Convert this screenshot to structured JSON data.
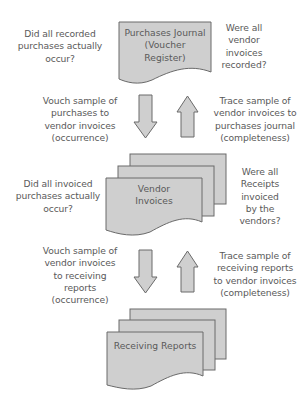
{
  "colors": {
    "shape_fill": "#cfcfcf",
    "shape_stroke": "#6a6a6a",
    "text": "#5a5a5a"
  },
  "documents": [
    {
      "id": "purchases-journal",
      "lines": [
        "Purchases Journal",
        "(Voucher",
        "Register)"
      ]
    },
    {
      "id": "vendor-invoices",
      "lines": [
        "Vendor",
        "Invoices"
      ]
    },
    {
      "id": "receiving-reports",
      "lines": [
        "Receiving Reports"
      ]
    }
  ],
  "questions": {
    "top_left": [
      "Did all recorded",
      "purchases actually",
      "occur?"
    ],
    "top_right": [
      "Were all",
      "vendor",
      "invoices",
      "recorded?"
    ],
    "middle_left": [
      "Did all invoiced",
      "purchases actually",
      "occur?"
    ],
    "middle_right": [
      "Were all",
      "Receipts",
      "invoiced",
      "by the",
      "vendors?"
    ]
  },
  "procedures": {
    "vouch_1": [
      "Vouch sample of",
      "purchases to",
      "vendor invoices",
      "(occurrence)"
    ],
    "trace_1": [
      "Trace sample of",
      "vendor invoices to",
      "purchases journal",
      "(completeness)"
    ],
    "vouch_2": [
      "Vouch sample of",
      "vendor invoices",
      "to receiving",
      "reports",
      "(occurrence)"
    ],
    "trace_2": [
      "Trace sample of",
      "receiving reports",
      "to vendor invoices",
      "(completeness)"
    ]
  },
  "arrows": [
    {
      "id": "vouch-arrow-1",
      "direction": "down"
    },
    {
      "id": "trace-arrow-1",
      "direction": "up"
    },
    {
      "id": "vouch-arrow-2",
      "direction": "down"
    },
    {
      "id": "trace-arrow-2",
      "direction": "up"
    }
  ]
}
